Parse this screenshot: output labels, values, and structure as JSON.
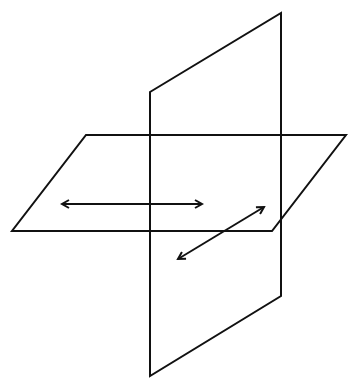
{
  "diagram": {
    "type": "intersecting-planes",
    "stroke_color": "#111111",
    "background": "#ffffff",
    "vertical_plane": {
      "points": [
        [
          150,
          92
        ],
        [
          281,
          13
        ],
        [
          281,
          296
        ],
        [
          150,
          376
        ]
      ]
    },
    "horizontal_plane": {
      "points": [
        [
          86,
          135
        ],
        [
          346,
          135
        ],
        [
          272,
          231
        ],
        [
          12,
          231
        ]
      ]
    },
    "arrows": [
      {
        "name": "horizontal-double-arrow",
        "from": [
          62,
          204
        ],
        "to": [
          202,
          204
        ]
      },
      {
        "name": "diagonal-double-arrow",
        "from": [
          178,
          259
        ],
        "to": [
          264,
          207
        ]
      }
    ]
  }
}
